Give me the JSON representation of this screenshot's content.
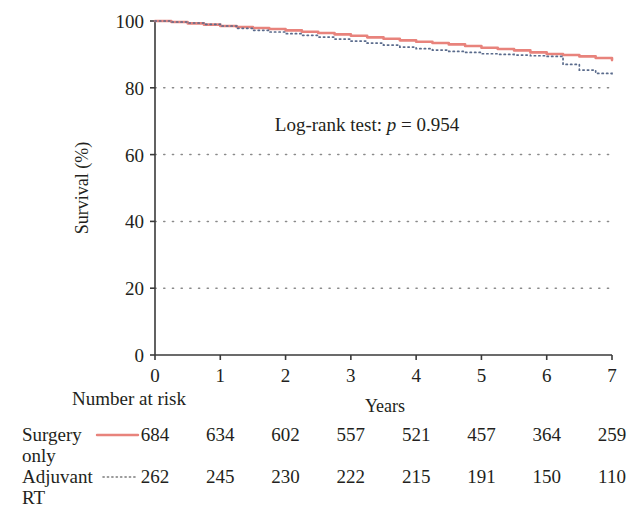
{
  "chart_data": {
    "type": "line",
    "title": "",
    "xlabel": "Years",
    "ylabel": "Survival (%)",
    "xlim": [
      0,
      7
    ],
    "ylim": [
      0,
      100
    ],
    "xticks": [
      "0",
      "1",
      "2",
      "3",
      "4",
      "5",
      "6",
      "7"
    ],
    "yticks": [
      "0",
      "20",
      "40",
      "60",
      "80",
      "100"
    ],
    "grid": "horizontal-dotted",
    "legend_position": "below-plot-risk-table",
    "annotation": {
      "prefix": "Log-rank test: ",
      "italic_symbol": "p",
      "suffix": " = 0.954",
      "full": "Log-rank test: p = 0.954"
    },
    "series": [
      {
        "name": "Surgery only",
        "style": "solid",
        "color": "#e8837c",
        "x": [
          0,
          0.25,
          0.5,
          0.75,
          1.0,
          1.25,
          1.5,
          1.75,
          2.0,
          2.25,
          2.5,
          2.75,
          3.0,
          3.25,
          3.5,
          3.75,
          4.0,
          4.25,
          4.5,
          4.75,
          5.0,
          5.25,
          5.5,
          5.75,
          6.0,
          6.25,
          6.5,
          6.75,
          7.0
        ],
        "values": [
          100,
          99.7,
          99.3,
          98.9,
          98.5,
          98.2,
          97.9,
          97.6,
          97.2,
          96.8,
          96.4,
          96.0,
          95.6,
          95.1,
          94.7,
          94.2,
          93.8,
          93.4,
          93.0,
          92.5,
          92.0,
          91.6,
          91.2,
          90.6,
          90.1,
          89.8,
          89.4,
          88.9,
          88.3
        ]
      },
      {
        "name": "Adjuvant RT",
        "style": "dotted",
        "color": "#5a6b8c",
        "x": [
          0,
          0.25,
          0.5,
          0.75,
          1.0,
          1.25,
          1.5,
          1.75,
          2.0,
          2.25,
          2.5,
          2.75,
          3.0,
          3.25,
          3.5,
          3.75,
          4.0,
          4.25,
          4.5,
          4.75,
          5.0,
          5.25,
          5.5,
          5.75,
          6.0,
          6.25,
          6.5,
          6.75,
          7.0
        ],
        "values": [
          100,
          99.7,
          99.4,
          99.0,
          98.5,
          97.8,
          97.2,
          96.7,
          96.2,
          95.7,
          95.2,
          94.6,
          94.0,
          93.4,
          92.8,
          92.2,
          91.7,
          91.3,
          90.9,
          90.6,
          90.2,
          90.0,
          89.8,
          89.6,
          89.4,
          87.0,
          85.3,
          84.3,
          83.6
        ]
      }
    ]
  },
  "risk_table": {
    "heading": "Number at risk",
    "xlabel": "Years",
    "times": [
      "0",
      "1",
      "2",
      "3",
      "4",
      "5",
      "6",
      "7"
    ],
    "rows": [
      {
        "label_line1": "Surgery",
        "label_line2": "only",
        "legend_style": "solid",
        "legend_color": "#e8837c",
        "counts": [
          "684",
          "634",
          "602",
          "557",
          "521",
          "457",
          "364",
          "259"
        ]
      },
      {
        "label_line1": "Adjuvant",
        "label_line2": "RT",
        "legend_style": "dotted",
        "legend_color": "#7a7a7a",
        "counts": [
          "262",
          "245",
          "230",
          "222",
          "215",
          "191",
          "150",
          "110"
        ]
      }
    ]
  },
  "colors": {
    "surgery_only": "#e8837c",
    "adjuvant_rt": "#5a6b8c",
    "axis": "#3a3a3a",
    "grid_dot": "#8a8a8a",
    "text": "#231f20"
  }
}
